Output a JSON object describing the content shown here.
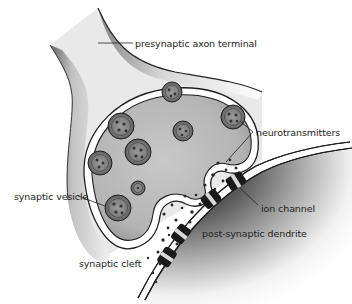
{
  "diagram": {
    "type": "biology-illustration",
    "labels": {
      "presynaptic": "presynaptic axon terminal",
      "neurotransmitters": "neurotransmitters",
      "vesicle": "synaptic vesicle",
      "ion_channel": "ion channel",
      "dendrite": "post-synaptic dendrite",
      "cleft": "synaptic cleft"
    },
    "colors": {
      "background": "#ffffff",
      "cytoplasm": "#b9b9b9",
      "membrane_outline": "#1e1e1e",
      "vesicle_fill": "#8a8a8a",
      "channel": "#1a1a1a",
      "channel_band": "#d8d8d8",
      "dendrite_shadow": "#4a4a4a",
      "text": "#222222"
    }
  }
}
